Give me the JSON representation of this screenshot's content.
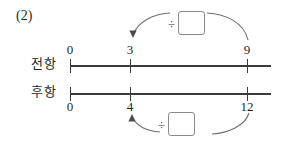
{
  "problem": {
    "number_label": "(2)"
  },
  "rows": [
    {
      "name": "antecedent",
      "label": "전항",
      "label_position": "left",
      "tick_label_position": "above",
      "ticks": [
        {
          "value": "0",
          "x": 70
        },
        {
          "value": "3",
          "x": 130
        },
        {
          "value": "9",
          "x": 247
        }
      ],
      "relation": {
        "operator": "÷",
        "answer": "",
        "from_value": "9",
        "to_value": "3",
        "arc_position": "above"
      }
    },
    {
      "name": "consequent",
      "label": "후항",
      "label_position": "left",
      "tick_label_position": "below",
      "ticks": [
        {
          "value": "0",
          "x": 70
        },
        {
          "value": "4",
          "x": 130
        },
        {
          "value": "12",
          "x": 247
        }
      ],
      "relation": {
        "operator": "÷",
        "answer": "",
        "from_value": "12",
        "to_value": "4",
        "arc_position": "below"
      }
    }
  ],
  "colors": {
    "ink": "#1f1f1f",
    "line": "#3b3b3b",
    "arc": "#6f6f6f",
    "box_border": "#8a8a8a",
    "paper": "#ffffff"
  }
}
